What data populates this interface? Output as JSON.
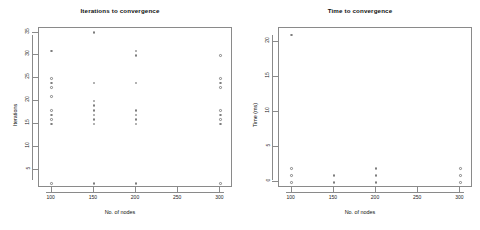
{
  "figure": {
    "background": "#ffffff",
    "point_color": "#7d7d7d",
    "axis_color": "#8a8a8a",
    "text_color": "#111111"
  },
  "chart_data": [
    {
      "type": "scatter",
      "panel": "left",
      "title": "Iterations to convergence",
      "xlabel": "No. of nodes",
      "ylabel": "Iterations",
      "xlim": [
        85,
        315
      ],
      "ylim": [
        1,
        36
      ],
      "xticks": [
        100,
        150,
        200,
        250,
        300
      ],
      "yticks": [
        5,
        10,
        15,
        20,
        25,
        30,
        35
      ],
      "grid": false,
      "legend": "none",
      "marker": "open-circle",
      "points": [
        {
          "x": 100,
          "y": 31
        },
        {
          "x": 100,
          "y": 25
        },
        {
          "x": 100,
          "y": 24
        },
        {
          "x": 100,
          "y": 23
        },
        {
          "x": 100,
          "y": 21
        },
        {
          "x": 100,
          "y": 18
        },
        {
          "x": 100,
          "y": 17
        },
        {
          "x": 100,
          "y": 16
        },
        {
          "x": 100,
          "y": 15
        },
        {
          "x": 100,
          "y": 2
        },
        {
          "x": 150,
          "y": 35
        },
        {
          "x": 150,
          "y": 24
        },
        {
          "x": 150,
          "y": 20
        },
        {
          "x": 150,
          "y": 19
        },
        {
          "x": 150,
          "y": 18
        },
        {
          "x": 150,
          "y": 17
        },
        {
          "x": 150,
          "y": 16
        },
        {
          "x": 150,
          "y": 15
        },
        {
          "x": 150,
          "y": 2
        },
        {
          "x": 200,
          "y": 31
        },
        {
          "x": 200,
          "y": 30
        },
        {
          "x": 200,
          "y": 24
        },
        {
          "x": 200,
          "y": 18
        },
        {
          "x": 200,
          "y": 17
        },
        {
          "x": 200,
          "y": 16
        },
        {
          "x": 200,
          "y": 15
        },
        {
          "x": 200,
          "y": 2
        },
        {
          "x": 300,
          "y": 30
        },
        {
          "x": 300,
          "y": 25
        },
        {
          "x": 300,
          "y": 24
        },
        {
          "x": 300,
          "y": 23
        },
        {
          "x": 300,
          "y": 18
        },
        {
          "x": 300,
          "y": 17
        },
        {
          "x": 300,
          "y": 16
        },
        {
          "x": 300,
          "y": 15
        },
        {
          "x": 300,
          "y": 2
        }
      ]
    },
    {
      "type": "scatter",
      "panel": "right",
      "title": "Time to convergence",
      "xlabel": "No. of nodes",
      "ylabel": "Time (ms)",
      "xlim": [
        85,
        315
      ],
      "ylim": [
        -0.8,
        22
      ],
      "xticks": [
        100,
        150,
        200,
        250,
        300
      ],
      "yticks": [
        0,
        5,
        10,
        15,
        20
      ],
      "grid": false,
      "legend": "none",
      "marker": "open-circle",
      "points": [
        {
          "x": 100,
          "y": 21
        },
        {
          "x": 100,
          "y": 2
        },
        {
          "x": 100,
          "y": 1
        },
        {
          "x": 100,
          "y": 0
        },
        {
          "x": 150,
          "y": 1
        },
        {
          "x": 150,
          "y": 0
        },
        {
          "x": 200,
          "y": 2
        },
        {
          "x": 200,
          "y": 1
        },
        {
          "x": 200,
          "y": 0
        },
        {
          "x": 300,
          "y": 2
        },
        {
          "x": 300,
          "y": 1
        },
        {
          "x": 300,
          "y": 0
        }
      ]
    }
  ]
}
